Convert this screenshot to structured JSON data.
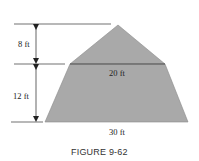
{
  "figure": {
    "caption": "FIGURE 9-62",
    "fill_color": "#a9a9a9",
    "line_color": "#333333",
    "dimensions": {
      "triangle_height": "8 ft",
      "trapezoid_height": "12 ft",
      "top_width": "20 ft",
      "bottom_width": "30 ft"
    }
  }
}
